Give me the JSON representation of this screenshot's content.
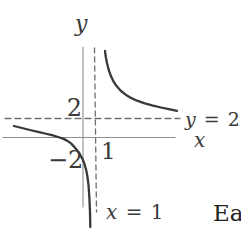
{
  "figure": {
    "y_axis_label": "y",
    "x_axis_label": "x",
    "ticks": {
      "y2": "2",
      "yneg2": "−2",
      "x1": "1"
    },
    "asymptote_labels": {
      "horizontal_var": "y",
      "horizontal_rest": " = 2",
      "vertical_var": "x",
      "vertical_rest": " = 1"
    },
    "page_text_fragment": "Ea"
  },
  "colors": {
    "background": "#ffffff",
    "curve": "#383838",
    "axis": "#8e8e8e",
    "dashed": "#6f6f6f",
    "text": "#3a3a3a"
  },
  "chart_data": {
    "type": "line",
    "title": "",
    "xlabel": "x",
    "ylabel": "y",
    "asymptotes": {
      "vertical_x": 1,
      "horizontal_y": 2
    },
    "x_ticks": [
      {
        "value": 1,
        "label": "1"
      }
    ],
    "y_ticks": [
      {
        "value": 2,
        "label": "2"
      },
      {
        "value": -2,
        "label": "−2"
      }
    ],
    "grid": false,
    "legend": false,
    "series": [
      {
        "name": "left-branch",
        "points": [
          [
            -5.8,
            1.2
          ],
          [
            -4.4,
            0.8
          ],
          [
            -3.2,
            0.4
          ],
          [
            -2.1,
            0.1
          ],
          [
            -1.4,
            -0.3
          ],
          [
            -0.8,
            -0.9
          ],
          [
            -0.3,
            -1.6
          ],
          [
            0.1,
            -2.6
          ],
          [
            0.3,
            -3.8
          ],
          [
            0.5,
            -5.6
          ],
          [
            0.6,
            -9.2
          ]
        ]
      },
      {
        "name": "right-branch",
        "points": [
          [
            1.8,
            8.9
          ],
          [
            2.0,
            7.6
          ],
          [
            2.3,
            6.4
          ],
          [
            2.8,
            5.4
          ],
          [
            3.6,
            4.5
          ],
          [
            4.6,
            3.9
          ],
          [
            5.9,
            3.2
          ],
          [
            7.8,
            2.7
          ]
        ]
      }
    ],
    "render_px": {
      "axes": [
        {
          "name": "y-axis-line",
          "points": [
            [
              83,
              47
            ],
            [
              83,
              207
            ]
          ]
        },
        {
          "name": "x-axis-line",
          "points": [
            [
              3,
              137.5
            ],
            [
              175,
              137.5
            ]
          ]
        }
      ],
      "asymptotes": [
        {
          "name": "horizontal-asymptote-line",
          "dash": "6,4",
          "points": [
            [
              5,
              118.5
            ],
            [
              180,
              118.5
            ]
          ]
        },
        {
          "name": "vertical-asymptote-line",
          "dash": "5,4",
          "points": [
            [
              94.5,
              48
            ],
            [
              96.5,
              212
            ]
          ]
        }
      ],
      "curve_branches": [
        {
          "name": "left-branch-curve",
          "points": [
            [
              14,
              126
            ],
            [
              22,
              128
            ],
            [
              30,
              130
            ],
            [
              38,
              131.8
            ],
            [
              45,
              133.5
            ],
            [
              52,
              135.2
            ],
            [
              58,
              137
            ],
            [
              63,
              138.6
            ],
            [
              67,
              140.6
            ],
            [
              71,
              143.4
            ],
            [
              74,
              146.6
            ],
            [
              77,
              150.2
            ],
            [
              80,
              154.6
            ],
            [
              82.5,
              159
            ],
            [
              84.5,
              164
            ],
            [
              86.2,
              170
            ],
            [
              87.5,
              177
            ],
            [
              88.6,
              186
            ],
            [
              89.4,
              198
            ],
            [
              90,
              212
            ],
            [
              90.3,
              227
            ]
          ]
        },
        {
          "name": "right-branch-curve",
          "points": [
            [
              105,
              51
            ],
            [
              105.8,
              57
            ],
            [
              107,
              63
            ],
            [
              108.6,
              69.5
            ],
            [
              110.8,
              75.8
            ],
            [
              113.5,
              81.5
            ],
            [
              117,
              86.6
            ],
            [
              121,
              91
            ],
            [
              125.7,
              94.7
            ],
            [
              131,
              97.9
            ],
            [
              137,
              100.7
            ],
            [
              144,
              103.2
            ],
            [
              152,
              105.4
            ],
            [
              161,
              107.5
            ],
            [
              170,
              109.4
            ],
            [
              177,
              110.8
            ]
          ]
        }
      ]
    }
  }
}
